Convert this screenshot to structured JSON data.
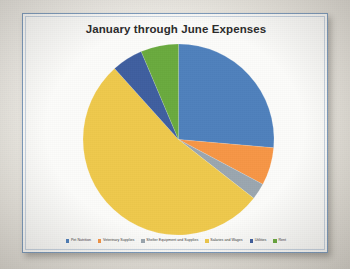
{
  "chart_data": {
    "type": "pie",
    "title": "January through June Expenses",
    "categories": [
      "Pet Nutrition",
      "Veterinary Supplies",
      "Shelter Equipment and Supplies",
      "Salaries and Wages",
      "Utilities",
      "Rent"
    ],
    "values": [
      26.4,
      6.4,
      2.8,
      52.8,
      5.3,
      6.4
    ],
    "units": "percent",
    "colors": [
      "#4F81BD",
      "#F79646",
      "#9BA7B0",
      "#EFC94C",
      "#3F5FA0",
      "#6AAB3E"
    ],
    "start_angle_deg": 0,
    "direction": "clockwise",
    "legend_position": "bottom",
    "grid": false,
    "xlabel": "",
    "ylabel": "",
    "slice_labels_shown": false,
    "slices": [
      {
        "label": "Pet Nutrition",
        "value": 26.4,
        "color": "#4F81BD",
        "start_deg": 0,
        "end_deg": 95
      },
      {
        "label": "Veterinary Supplies",
        "value": 6.4,
        "color": "#F79646",
        "start_deg": 95,
        "end_deg": 118
      },
      {
        "label": "Shelter Equipment and Supplies",
        "value": 2.8,
        "color": "#9BA7B0",
        "start_deg": 118,
        "end_deg": 128
      },
      {
        "label": "Salaries and Wages",
        "value": 52.8,
        "color": "#EFC94C",
        "start_deg": 128,
        "end_deg": 318
      },
      {
        "label": "Utilities",
        "value": 5.3,
        "color": "#3F5FA0",
        "start_deg": 318,
        "end_deg": 337
      },
      {
        "label": "Rent",
        "value": 6.4,
        "color": "#6AAB3E",
        "start_deg": 337,
        "end_deg": 360
      }
    ]
  },
  "card": {
    "border_color": "#7d9bbd",
    "background": "#fcfcfa"
  }
}
